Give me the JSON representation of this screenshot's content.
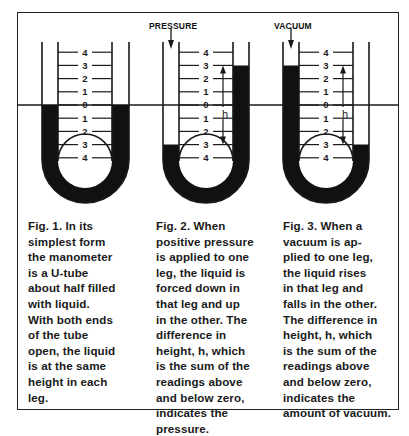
{
  "figure": {
    "scale_labels": [
      "4",
      "3",
      "2",
      "1",
      "0",
      "1",
      "2",
      "3",
      "4"
    ],
    "height_label": "h",
    "pressure_label": "PRESSURE",
    "vacuum_label": "VACUUM",
    "colors": {
      "liquid": "#111111",
      "line": "#1a1a1a",
      "background": "#ffffff"
    }
  },
  "panels": [
    {
      "id": "fig1",
      "caption": "Fig. 1.  In its\nsimplest form\nthe manometer\nis a U-tube\nabout half filled\nwith liquid.\nWith both ends\nof the tube\nopen, the liquid\nis at the same\nheight in each\nleg.",
      "left_level": 0,
      "right_level": 0
    },
    {
      "id": "fig2",
      "caption": "Fig. 2.  When\npositive pressure\nis applied to one\nleg, the liquid is\nforced down in\nthat leg and up\nin the other. The\ndifference in\nheight, h, which\nis the sum of the\nreadings above\nand below zero,\nindicates the\npressure.",
      "left_level": -3,
      "right_level": 3
    },
    {
      "id": "fig3",
      "caption": "Fig. 3.  When a\nvacuum is ap-\nplied to one leg,\nthe liquid rises\nin that leg and\nfalls in the other.\nThe difference in\nheight, h, which\nis the sum of the\nreadings above\nand below zero,\nindicates the\namount of vacuum.",
      "left_level": 3,
      "right_level": -3
    }
  ]
}
